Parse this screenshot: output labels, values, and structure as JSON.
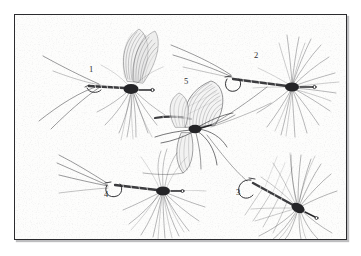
{
  "plate": {
    "caption_visible": false,
    "background_color": "#fdfdfc",
    "border_color": "#2b2b2e",
    "ink_color": "#27272a",
    "label_color": "#2e2e30",
    "frame": {
      "x": 14,
      "y": 14,
      "width": 333,
      "height": 226
    }
  },
  "labels": [
    {
      "text": "1",
      "x": 88,
      "y": 64
    },
    {
      "text": "2",
      "x": 253,
      "y": 50
    },
    {
      "text": "3",
      "x": 235,
      "y": 187
    },
    {
      "text": "4",
      "x": 103,
      "y": 189
    },
    {
      "text": "5",
      "x": 183,
      "y": 76
    }
  ],
  "figures": [
    {
      "id": "fly-1",
      "number": "1",
      "name": "upright-winged-mayfly-dun-dry-fly",
      "orientation": "hook-eye-left",
      "parts": [
        "three-long-tails",
        "slender-segmented-body",
        "paired-upright-wings",
        "dense-hackle-collar",
        "down-eye-hook"
      ],
      "anchor": {
        "x": 120,
        "y": 78
      }
    },
    {
      "id": "fly-2",
      "number": "2",
      "name": "hackle-spider-soft-hackle-fly",
      "orientation": "hook-eye-left",
      "parts": [
        "long-swept-tail-fibers",
        "thin-body",
        "radiating-hackle-fan",
        "up-eye-hook"
      ],
      "anchor": {
        "x": 290,
        "y": 72
      }
    },
    {
      "id": "fly-3",
      "number": "3",
      "number_position": "left-of-body",
      "name": "palmered-hackle-wet-fly",
      "orientation": "hook-eye-right",
      "parts": [
        "curved-hook-shank",
        "segmented-body",
        "long-splayed-hackle-fibers"
      ],
      "anchor": {
        "x": 278,
        "y": 188
      }
    },
    {
      "id": "fly-4",
      "number": "4",
      "name": "spent-wing-hackled-dry-fly",
      "orientation": "hook-eye-left",
      "parts": [
        "four-long-tail-fibers",
        "hook-bend-visible",
        "thin-body",
        "full-hackle-skirt",
        "short-wing-tuft"
      ],
      "anchor": {
        "x": 148,
        "y": 176
      }
    },
    {
      "id": "fly-5",
      "number": "5",
      "name": "realistic-veined-wing-mayfly",
      "orientation": "body-horizontal",
      "parts": [
        "veined-forewing",
        "veined-hindwing",
        "jointed-legs",
        "segmented-abdomen",
        "long-setae"
      ],
      "anchor": {
        "x": 196,
        "y": 116
      }
    }
  ]
}
